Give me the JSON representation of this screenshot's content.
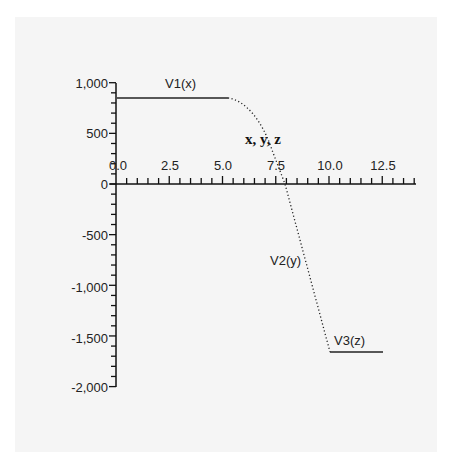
{
  "chart_data": {
    "type": "line",
    "title": "",
    "xlabel": "",
    "ylabel": "",
    "annotation": "x, y, z",
    "xlim": [
      0,
      14
    ],
    "ylim": [
      -2000,
      1000
    ],
    "x_ticks": [
      "0.0",
      "2.5",
      "5.0",
      "7.5",
      "10.0",
      "12.5"
    ],
    "y_ticks": [
      "1,000",
      "500",
      "0",
      "-500",
      "-1,000",
      "-1,500",
      "-2,000"
    ],
    "grid": false,
    "legend": "none (inline series labels)",
    "series": [
      {
        "name": "V1(x)",
        "style": "solid",
        "x": [
          0,
          5.25
        ],
        "y": [
          850,
          850
        ]
      },
      {
        "name": "V2(y)",
        "style": "dotted",
        "x": [
          5.25,
          5.75,
          6.25,
          6.75,
          7.25,
          7.9,
          8.5,
          9.0,
          9.5,
          10.0
        ],
        "y": [
          850,
          800,
          680,
          520,
          330,
          0,
          -470,
          -870,
          -1260,
          -1650
        ]
      },
      {
        "name": "V3(z)",
        "style": "solid",
        "x": [
          10.0,
          12.6
        ],
        "y": [
          -1650,
          -1650
        ]
      }
    ]
  },
  "labels": {
    "v1": "V1(x)",
    "v2": "V2(y)",
    "v3": "V3(z)",
    "annotation": "x, y, z",
    "x_ticks": [
      "0.0",
      "2.5",
      "5.0",
      "7.5",
      "10.0",
      "12.5"
    ],
    "y_ticks": [
      "1,000",
      "500",
      "0",
      "-500",
      "-1,000",
      "-1,500",
      "-2,000"
    ]
  }
}
